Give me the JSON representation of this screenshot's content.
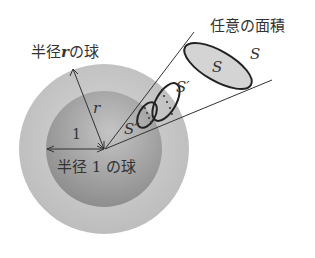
{
  "labels": {
    "outer_sphere": "半径",
    "outer_var": "r",
    "outer_suffix": "の球",
    "inner_sphere": "半径 1 の球",
    "arbitrary_area": "任意の面積",
    "radius_r": "r",
    "radius_1": "1",
    "S_inside": "S",
    "S_outside": "S",
    "S_prime": "S′",
    "S_double_prime": "S″"
  },
  "colors": {
    "outer_sphere": "#c8c8c8",
    "inner_sphere": "#a9a9a9",
    "ellipse_fill": "#d4d4d4",
    "line": "#333333"
  }
}
